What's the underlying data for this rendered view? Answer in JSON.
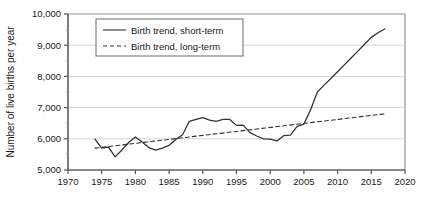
{
  "chart_data": {
    "type": "line",
    "title": "",
    "xlabel": "",
    "ylabel": "Number of live births per year",
    "xlim": [
      1970,
      2020
    ],
    "ylim": [
      5000,
      10000
    ],
    "grid": true,
    "legend_position": "top-left",
    "x_ticks": [
      "1970",
      "1975",
      "1980",
      "1985",
      "1990",
      "1995",
      "2000",
      "2005",
      "2010",
      "2015",
      "2020"
    ],
    "x_tick_values": [
      1970,
      1975,
      1980,
      1985,
      1990,
      1995,
      2000,
      2005,
      2010,
      2015,
      2020
    ],
    "y_ticks": [
      "5,000",
      "6,000",
      "7,000",
      "8,000",
      "9,000",
      "10,000"
    ],
    "y_tick_values": [
      5000,
      6000,
      7000,
      8000,
      9000,
      10000
    ],
    "series": [
      {
        "name": "Birth trend, short-term",
        "style": "solid",
        "color": "#333333",
        "x": [
          1974,
          1975,
          1976,
          1977,
          1978,
          1979,
          1980,
          1981,
          1982,
          1983,
          1984,
          1985,
          1986,
          1987,
          1988,
          1989,
          1990,
          1991,
          1992,
          1993,
          1994,
          1995,
          1996,
          1997,
          1998,
          1999,
          2000,
          2001,
          2002,
          2003,
          2004,
          2005,
          2006,
          2007,
          2008,
          2009,
          2010,
          2011,
          2012,
          2013,
          2014,
          2015,
          2016,
          2017
        ],
        "values": [
          5990,
          5700,
          5730,
          5420,
          5640,
          5880,
          6060,
          5900,
          5720,
          5640,
          5700,
          5790,
          5980,
          6130,
          6560,
          6620,
          6680,
          6600,
          6560,
          6620,
          6620,
          6430,
          6440,
          6200,
          6090,
          6000,
          5990,
          5930,
          6100,
          6120,
          6400,
          6470,
          6930,
          7500,
          7720,
          7930,
          8150,
          8370,
          8590,
          8810,
          9030,
          9250,
          9400,
          9520
        ]
      },
      {
        "name": "Birth trend, long-term",
        "style": "dashed",
        "color": "#333333",
        "x": [
          1974,
          2017
        ],
        "values": [
          5700,
          6800
        ]
      }
    ],
    "legend": [
      {
        "label": "Birth trend, short-term",
        "style": "solid"
      },
      {
        "label": "Birth trend, long-term",
        "style": "dashed"
      }
    ]
  }
}
